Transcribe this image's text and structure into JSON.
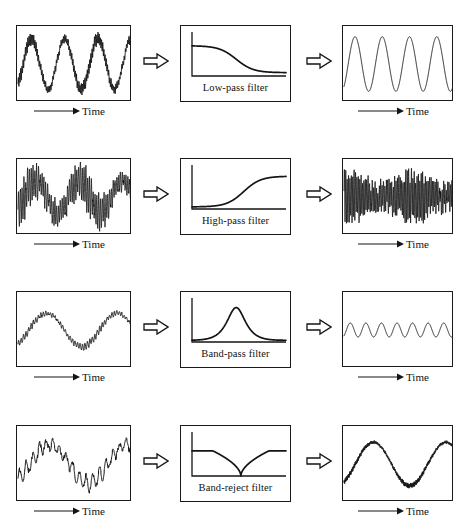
{
  "figure": {
    "background_color": "#ffffff",
    "ink_color": "#1a1a1a",
    "time_axis_label": "Time",
    "arrow_glyph": "double-right-arrow"
  },
  "rows": [
    {
      "id": "low-pass",
      "filter_label": "Low-pass filter",
      "input_signal": {
        "name": "low-frequency sine with heavy high-frequency noise",
        "carrier_cycles": 3.4,
        "carrier_amplitude": 0.72,
        "noise_cycles": 95,
        "noise_amplitude": 0.16,
        "line_width": 0.9
      },
      "response": {
        "name": "low-pass magnitude response",
        "shape": "sigmoid-falling",
        "pass_level": 0.72,
        "stop_level": 0.08,
        "corner": 0.47,
        "steepness": 11
      },
      "output_signal": {
        "name": "clean low-frequency sine",
        "carrier_cycles": 4.0,
        "carrier_amplitude": 0.78,
        "noise_cycles": 0,
        "noise_amplitude": 0,
        "line_width": 0.9
      }
    },
    {
      "id": "high-pass",
      "filter_label": "High-pass filter",
      "input_signal": {
        "name": "low-frequency sine carrying a dense high-frequency band",
        "carrier_cycles": 2.6,
        "carrier_amplitude": 0.45,
        "noise_cycles": 62,
        "noise_amplitude": 0.5,
        "line_width": 0.8
      },
      "response": {
        "name": "high-pass magnitude response",
        "shape": "sigmoid-rising",
        "pass_level": 0.78,
        "stop_level": 0.05,
        "corner": 0.55,
        "steepness": 11
      },
      "output_signal": {
        "name": "high-frequency band only, constant envelope",
        "carrier_cycles": 0,
        "carrier_amplitude": 0.1,
        "noise_cycles": 78,
        "noise_amplitude": 0.62,
        "line_width": 0.8
      }
    },
    {
      "id": "band-pass",
      "filter_label": "Band-pass filter",
      "input_signal": {
        "name": "slow drift with small mid-frequency ripple",
        "carrier_cycles": 1.6,
        "carrier_amplitude": 0.48,
        "noise_cycles": 46,
        "noise_amplitude": 0.09,
        "line_width": 0.9
      },
      "response": {
        "name": "band-pass magnitude response",
        "shape": "peak",
        "peak_level": 0.82,
        "baseline": 0.04,
        "center": 0.47,
        "width": 0.14
      },
      "output_signal": {
        "name": "small constant-amplitude mid-frequency sine",
        "carrier_cycles": 7.0,
        "carrier_amplitude": 0.2,
        "noise_cycles": 0,
        "noise_amplitude": 0,
        "line_width": 0.9
      }
    },
    {
      "id": "band-reject",
      "filter_label": "Band-reject filter",
      "input_signal": {
        "name": "slow sine with strong sawtooth interference",
        "carrier_cycles": 1.45,
        "carrier_amplitude": 0.55,
        "noise_cycles": 17,
        "noise_amplitude": 0.24,
        "line_width": 1.0
      },
      "response": {
        "name": "band-reject (notch) magnitude response",
        "shape": "notch",
        "pass_level": 0.6,
        "notch_depth": 0.0,
        "center": 0.52,
        "width": 0.3
      },
      "output_signal": {
        "name": "slow sine with residual fine texture",
        "carrier_cycles": 1.5,
        "carrier_amplitude": 0.62,
        "noise_cycles": 120,
        "noise_amplitude": 0.06,
        "line_width": 1.0
      }
    }
  ],
  "chart_data": {
    "type": "line",
    "xlabel": "Time",
    "ylabel": "",
    "grid": false,
    "legend": "none",
    "panels": [
      {
        "row": "low-pass",
        "input": {
          "description": "noisy sine",
          "cycles": 3.4,
          "amplitude": 0.72,
          "noise": 0.16
        },
        "filter": {
          "label": "Low-pass filter",
          "response": "falling sigmoid",
          "corner_freq_norm": 0.47
        },
        "output": {
          "description": "clean sine",
          "cycles": 4.0,
          "amplitude": 0.78,
          "noise": 0.0
        }
      },
      {
        "row": "high-pass",
        "input": {
          "description": "modulated high-frequency burst",
          "cycles": 2.6,
          "amplitude": 0.45,
          "noise": 0.5
        },
        "filter": {
          "label": "High-pass filter",
          "response": "rising sigmoid",
          "corner_freq_norm": 0.55
        },
        "output": {
          "description": "high-frequency band",
          "cycles": 0,
          "amplitude": 0.1,
          "noise": 0.62
        }
      },
      {
        "row": "band-pass",
        "input": {
          "description": "drift plus ripple",
          "cycles": 1.6,
          "amplitude": 0.48,
          "noise": 0.09
        },
        "filter": {
          "label": "Band-pass filter",
          "response": "single peak",
          "center_freq_norm": 0.47
        },
        "output": {
          "description": "small mid-frequency sine",
          "cycles": 7.0,
          "amplitude": 0.2,
          "noise": 0.0
        }
      },
      {
        "row": "band-reject",
        "input": {
          "description": "sine plus sawtooth interference",
          "cycles": 1.45,
          "amplitude": 0.55,
          "noise": 0.24
        },
        "filter": {
          "label": "Band-reject filter",
          "response": "notch",
          "center_freq_norm": 0.52
        },
        "output": {
          "description": "sine with fine texture",
          "cycles": 1.5,
          "amplitude": 0.62,
          "noise": 0.06
        }
      }
    ]
  }
}
